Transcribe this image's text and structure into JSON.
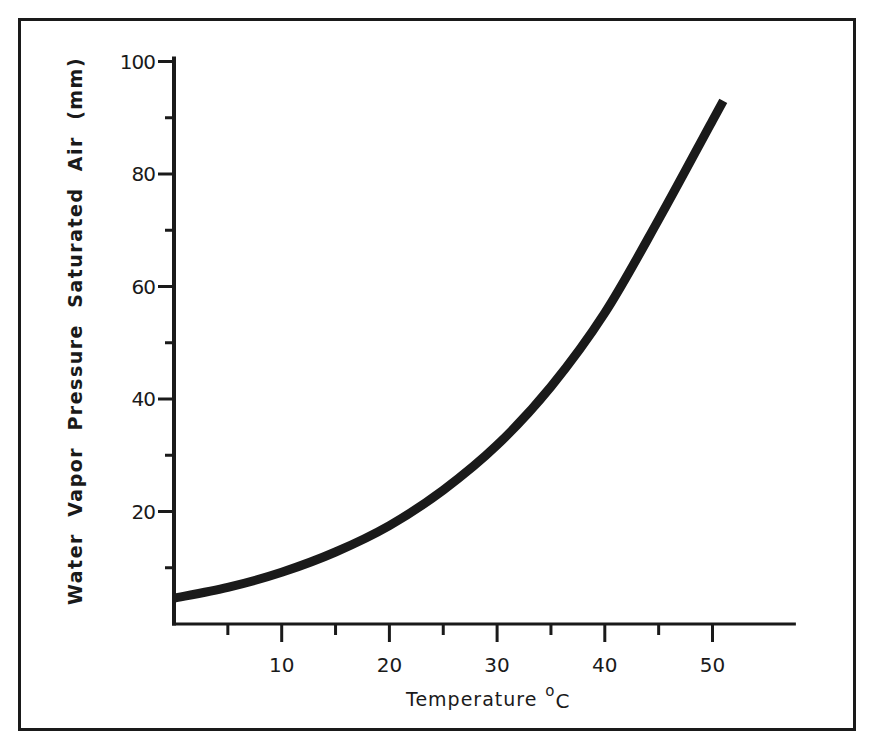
{
  "chart_data": {
    "type": "line",
    "title": "",
    "xlabel": "Temperature",
    "xlabel_unit_superscript": "o",
    "xlabel_unit": "C",
    "ylabel": "Water  Vapor  Pressure  Saturated  Air  (mm)",
    "xlim": [
      0,
      57
    ],
    "ylim": [
      0,
      100
    ],
    "x_major_ticks": [
      10,
      20,
      30,
      40,
      50
    ],
    "x_minor_ticks": [
      5,
      15,
      25,
      35,
      45
    ],
    "y_major_ticks": [
      20,
      40,
      60,
      80,
      100
    ],
    "y_minor_ticks": [
      10,
      30,
      50,
      70,
      90
    ],
    "grid": false,
    "legend": null,
    "series": [
      {
        "name": "Saturated water vapor pressure",
        "x": [
          0,
          5,
          10,
          15,
          20,
          25,
          30,
          35,
          40,
          45,
          50,
          51
        ],
        "y": [
          4.6,
          6.5,
          9.2,
          12.8,
          17.5,
          23.8,
          31.8,
          42.2,
          55.3,
          71.9,
          89.5,
          93
        ]
      }
    ]
  },
  "colors": {
    "background": "#ffffff",
    "ink": "#1a1a1a"
  }
}
